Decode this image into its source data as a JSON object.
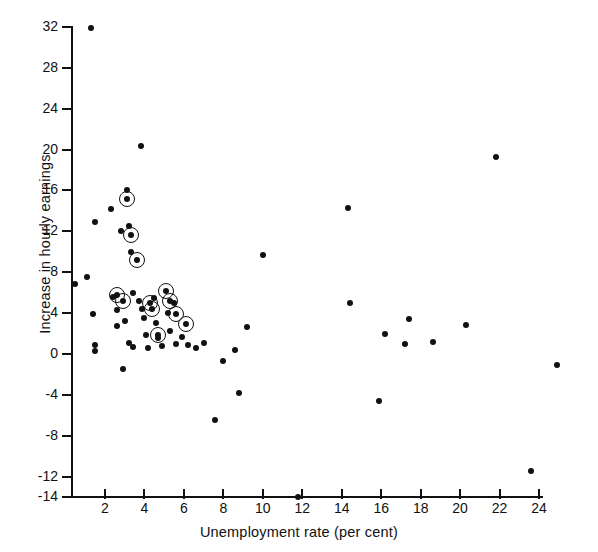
{
  "chart_data": {
    "type": "scatter",
    "title": "",
    "xlabel": "Unemployment rate (per cent)",
    "ylabel": "Increase in hourly earnings",
    "xlim": [
      0.2,
      25.7
    ],
    "ylim": [
      -14,
      32
    ],
    "xticks": [
      2,
      4,
      6,
      8,
      10,
      12,
      14,
      16,
      18,
      20,
      22,
      24
    ],
    "yticks": [
      -14,
      -12,
      -8,
      -4,
      0,
      4,
      8,
      12,
      16,
      20,
      24,
      28,
      32
    ],
    "xtick_labels": [
      "2",
      "4",
      "6",
      "8",
      "10",
      "12",
      "14",
      "16",
      "18",
      "20",
      "22",
      "24"
    ],
    "ytick_labels": [
      "-14",
      "-12",
      "-8",
      "-4",
      "0",
      "4",
      "8",
      "12",
      "16",
      "20",
      "24",
      "28",
      "32"
    ],
    "grid": false,
    "legend": null,
    "marker_color": "#111111",
    "series": [
      {
        "name": "observations",
        "marker": "filled-circle",
        "points": [
          [
            1.3,
            31.9
          ],
          [
            0.5,
            6.8
          ],
          [
            1.1,
            7.5
          ],
          [
            1.5,
            12.9
          ],
          [
            1.4,
            3.9
          ],
          [
            1.5,
            0.9
          ],
          [
            1.5,
            0.3
          ],
          [
            2.4,
            5.6
          ],
          [
            2.6,
            4.3
          ],
          [
            2.6,
            2.7
          ],
          [
            2.3,
            14.2
          ],
          [
            2.8,
            12.0
          ],
          [
            3.1,
            16.0
          ],
          [
            3.2,
            12.5
          ],
          [
            3.3,
            10.0
          ],
          [
            3.4,
            6.0
          ],
          [
            3.0,
            3.2
          ],
          [
            3.2,
            1.1
          ],
          [
            3.4,
            0.7
          ],
          [
            2.9,
            -1.5
          ],
          [
            3.8,
            20.4
          ],
          [
            3.7,
            5.2
          ],
          [
            3.9,
            4.4
          ],
          [
            4.0,
            3.5
          ],
          [
            4.1,
            1.9
          ],
          [
            4.2,
            0.6
          ],
          [
            4.5,
            5.5
          ],
          [
            4.6,
            3.0
          ],
          [
            4.7,
            1.6
          ],
          [
            4.9,
            0.8
          ],
          [
            5.2,
            4.0
          ],
          [
            5.3,
            2.2
          ],
          [
            5.5,
            5.0
          ],
          [
            5.6,
            1.0
          ],
          [
            5.9,
            1.7
          ],
          [
            6.2,
            0.9
          ],
          [
            6.6,
            0.6
          ],
          [
            7.0,
            1.1
          ],
          [
            7.6,
            -6.5
          ],
          [
            8.0,
            -0.7
          ],
          [
            8.6,
            0.4
          ],
          [
            8.8,
            -3.8
          ],
          [
            9.2,
            2.6
          ],
          [
            10.0,
            9.7
          ],
          [
            11.8,
            -14.0
          ],
          [
            14.3,
            14.3
          ],
          [
            14.4,
            5.0
          ],
          [
            15.9,
            -4.6
          ],
          [
            16.2,
            2.0
          ],
          [
            17.2,
            1.0
          ],
          [
            17.4,
            3.4
          ],
          [
            18.6,
            1.2
          ],
          [
            20.3,
            2.8
          ],
          [
            21.8,
            19.3
          ],
          [
            23.6,
            -11.5
          ],
          [
            24.9,
            -1.1
          ]
        ]
      },
      {
        "name": "highlighted observations",
        "marker": "circled-filled-circle",
        "points": [
          [
            3.1,
            15.2
          ],
          [
            3.3,
            11.6
          ],
          [
            3.6,
            9.2
          ],
          [
            2.6,
            5.8
          ],
          [
            2.9,
            5.2
          ],
          [
            4.3,
            5.0
          ],
          [
            4.4,
            4.4
          ],
          [
            5.1,
            6.2
          ],
          [
            5.3,
            5.2
          ],
          [
            5.6,
            3.9
          ],
          [
            4.7,
            1.9
          ],
          [
            6.1,
            2.9
          ]
        ]
      }
    ]
  }
}
